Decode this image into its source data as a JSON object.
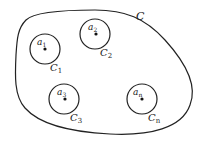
{
  "diagram": {
    "outer_region": {
      "label": "C",
      "subscript": ""
    },
    "points": [
      {
        "id": "a1",
        "point_label": "a",
        "point_sub": "1",
        "circle_label": "C",
        "circle_sub": "1"
      },
      {
        "id": "a2",
        "point_label": "a",
        "point_sub": "2",
        "circle_label": "C",
        "circle_sub": "2"
      },
      {
        "id": "a3",
        "point_label": "a",
        "point_sub": "3",
        "circle_label": "C",
        "circle_sub": "3"
      },
      {
        "id": "an",
        "point_label": "a",
        "point_sub": "n",
        "circle_label": "C",
        "circle_sub": "n"
      }
    ],
    "colors": {
      "stroke": "#222222",
      "background": "#ffffff"
    }
  }
}
